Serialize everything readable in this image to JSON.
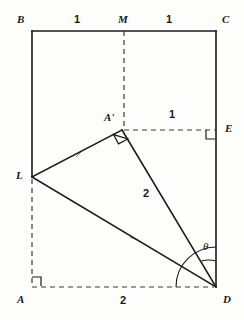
{
  "figure": {
    "kind": "geometry-diagram",
    "stroke_color": "#1a1a1a",
    "background_color": "#fdfdfc",
    "vertices": [
      {
        "id": "B",
        "label": "B",
        "x": 32,
        "y": 31,
        "label_x": 17,
        "label_y": 14
      },
      {
        "id": "M",
        "label": "M",
        "x": 124,
        "y": 31,
        "label_x": 118,
        "label_y": 14
      },
      {
        "id": "C",
        "label": "C",
        "x": 216,
        "y": 31,
        "label_x": 222,
        "label_y": 14
      },
      {
        "id": "E",
        "label": "E",
        "x": 216,
        "y": 130,
        "label_x": 225,
        "label_y": 123
      },
      {
        "id": "Aprime",
        "label": "A'",
        "x": 122,
        "y": 130,
        "label_x": 104,
        "label_y": 112
      },
      {
        "id": "L",
        "label": "L",
        "x": 32,
        "y": 177,
        "label_x": 16,
        "label_y": 170
      },
      {
        "id": "A",
        "label": "A",
        "x": 32,
        "y": 287,
        "label_x": 17,
        "label_y": 294
      },
      {
        "id": "D",
        "label": "D",
        "x": 216,
        "y": 287,
        "label_x": 223,
        "label_y": 294
      }
    ],
    "measure_labels": [
      {
        "id": "BM",
        "text": "1",
        "x": 74,
        "y": 14
      },
      {
        "id": "MC",
        "text": "1",
        "x": 166,
        "y": 14
      },
      {
        "id": "AprimeE",
        "text": "1",
        "x": 169,
        "y": 109
      },
      {
        "id": "AprimeD",
        "text": "2",
        "x": 143,
        "y": 188
      },
      {
        "id": "AD",
        "text": "2",
        "x": 120,
        "y": 295
      }
    ],
    "angle_labels": [
      {
        "id": "theta",
        "text": "θ",
        "x": 203,
        "y": 241
      }
    ],
    "solid_segments": [
      {
        "id": "BC",
        "from": "B",
        "to": "C"
      },
      {
        "id": "BL",
        "from": "B",
        "to": "L"
      },
      {
        "id": "CD",
        "from": "C",
        "to": "D"
      },
      {
        "id": "LAprime",
        "from": "L",
        "to": "Aprime"
      },
      {
        "id": "AprimeD",
        "from": "Aprime",
        "to": "D"
      },
      {
        "id": "LD",
        "from": "L",
        "to": "D"
      }
    ],
    "dashed_segments": [
      {
        "id": "MAprime",
        "from": "M",
        "to": "Aprime"
      },
      {
        "id": "AprimeE",
        "from": "Aprime",
        "to": "E"
      },
      {
        "id": "LA",
        "from": "L",
        "to": "A"
      },
      {
        "id": "AD",
        "from": "A",
        "to": "D"
      }
    ],
    "right_angle_marks": [
      {
        "id": "right-angle-at-Aprime",
        "at": "Aprime"
      },
      {
        "id": "right-angle-at-E",
        "at": "E"
      },
      {
        "id": "right-angle-at-A",
        "at": "A"
      }
    ],
    "angle_arcs": [
      {
        "id": "theta-arc-inner",
        "at": "D",
        "radius": 26
      },
      {
        "id": "theta-arc-outer",
        "at": "D",
        "radius": 40
      }
    ],
    "tick_marks": [
      {
        "id": "tick-on-LAprime",
        "x": 79,
        "y": 154
      },
      {
        "id": "tick-on-LD",
        "x": 133,
        "y": 238
      }
    ]
  }
}
